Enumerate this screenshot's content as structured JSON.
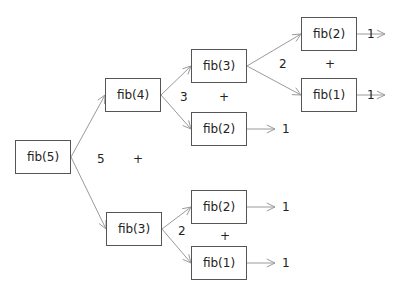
{
  "diagram": {
    "title": "",
    "nodes": [
      {
        "id": "n5",
        "label": "fib(5)",
        "x": 15,
        "y": 140,
        "w": 56,
        "h": 34
      },
      {
        "id": "n4",
        "label": "fib(4)",
        "x": 105,
        "y": 78,
        "w": 56,
        "h": 34
      },
      {
        "id": "n3a",
        "label": "fib(3)",
        "x": 191,
        "y": 49,
        "w": 56,
        "h": 34
      },
      {
        "id": "n2a",
        "label": "fib(2)",
        "x": 191,
        "y": 112,
        "w": 56,
        "h": 34
      },
      {
        "id": "n2b",
        "label": "fib(2)",
        "x": 301,
        "y": 17,
        "w": 56,
        "h": 34
      },
      {
        "id": "n1a",
        "label": "fib(1)",
        "x": 301,
        "y": 78,
        "w": 56,
        "h": 34
      },
      {
        "id": "n3b",
        "label": "fib(3)",
        "x": 106,
        "y": 212,
        "w": 56,
        "h": 34
      },
      {
        "id": "n2c",
        "label": "fib(2)",
        "x": 191,
        "y": 190,
        "w": 56,
        "h": 34
      },
      {
        "id": "n1b",
        "label": "fib(1)",
        "x": 191,
        "y": 246,
        "w": 56,
        "h": 34
      }
    ],
    "sums": [
      {
        "label": "5",
        "x": 97,
        "y": 153
      },
      {
        "label": "3",
        "x": 180,
        "y": 91
      },
      {
        "label": "2",
        "x": 279,
        "y": 58
      },
      {
        "label": "2",
        "x": 178,
        "y": 225
      }
    ],
    "plus_signs": [
      {
        "label": "+",
        "x": 133,
        "y": 153
      },
      {
        "label": "+",
        "x": 219,
        "y": 91
      },
      {
        "label": "+",
        "x": 325,
        "y": 58
      },
      {
        "label": "+",
        "x": 220,
        "y": 230
      }
    ],
    "results": [
      {
        "label": "1",
        "x": 367,
        "y": 28
      },
      {
        "label": "1",
        "x": 367,
        "y": 89
      },
      {
        "label": "1",
        "x": 282,
        "y": 123
      },
      {
        "label": "1",
        "x": 282,
        "y": 201
      },
      {
        "label": "1",
        "x": 282,
        "y": 257
      }
    ],
    "edges": [
      {
        "from": "n5",
        "to": "n4",
        "x1": 71,
        "y1": 157,
        "x2": 105,
        "y2": 95
      },
      {
        "from": "n5",
        "to": "n3b",
        "x1": 71,
        "y1": 157,
        "x2": 106,
        "y2": 229
      },
      {
        "from": "n4",
        "to": "n3a",
        "x1": 161,
        "y1": 95,
        "x2": 191,
        "y2": 66
      },
      {
        "from": "n4",
        "to": "n2a",
        "x1": 161,
        "y1": 95,
        "x2": 191,
        "y2": 129
      },
      {
        "from": "n3a",
        "to": "n2b",
        "x1": 247,
        "y1": 66,
        "x2": 301,
        "y2": 34
      },
      {
        "from": "n3a",
        "to": "n1a",
        "x1": 247,
        "y1": 66,
        "x2": 301,
        "y2": 95
      },
      {
        "from": "n3b",
        "to": "n2c",
        "x1": 162,
        "y1": 229,
        "x2": 191,
        "y2": 207
      },
      {
        "from": "n3b",
        "to": "n1b",
        "x1": 162,
        "y1": 229,
        "x2": 191,
        "y2": 263
      },
      {
        "from": "n2b",
        "to": "r",
        "x1": 357,
        "y1": 34,
        "x2": 360,
        "y2": 34
      },
      {
        "from": "n1a",
        "to": "r",
        "x1": 357,
        "y1": 95,
        "x2": 360,
        "y2": 95
      },
      {
        "from": "n2a",
        "to": "r",
        "x1": 247,
        "y1": 129,
        "x2": 275,
        "y2": 129
      },
      {
        "from": "n2c",
        "to": "r",
        "x1": 247,
        "y1": 207,
        "x2": 275,
        "y2": 207
      },
      {
        "from": "n1b",
        "to": "r",
        "x1": 247,
        "y1": 263,
        "x2": 275,
        "y2": 263
      }
    ],
    "colors": {
      "edge": "#9a9a9a",
      "border": "#555555",
      "text": "#222222"
    }
  }
}
